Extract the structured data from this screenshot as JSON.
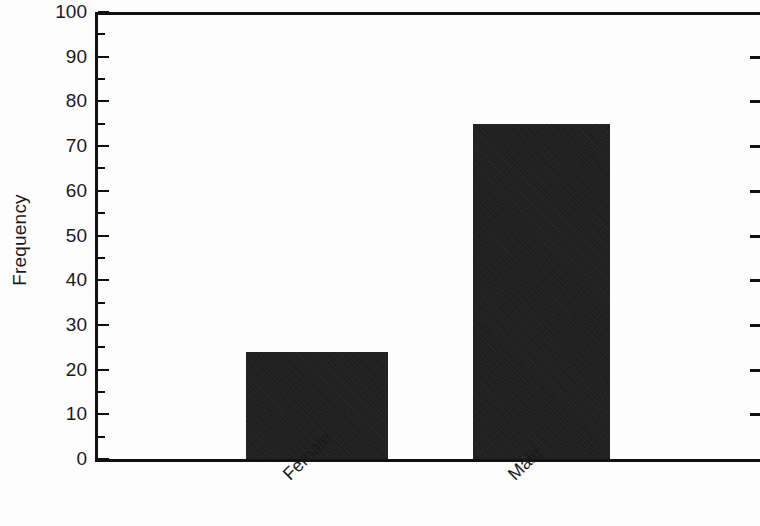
{
  "chart_data": {
    "type": "bar",
    "title": "",
    "subtitle": "",
    "xlabel": "",
    "ylabel": "Frequency",
    "categories": [
      "Female",
      "Male"
    ],
    "values": [
      24,
      75
    ],
    "series": [
      {
        "name": "Frequency",
        "values": [
          24,
          75
        ]
      }
    ],
    "ylim": [
      0,
      100
    ],
    "y_major_ticks": [
      0,
      10,
      20,
      30,
      40,
      50,
      60,
      70,
      80,
      90,
      100
    ],
    "y_minor_tick_interval": 5,
    "y_tick_labels": [
      "0",
      "10",
      "20",
      "30",
      "40",
      "50",
      "60",
      "70",
      "80",
      "90",
      "100"
    ],
    "grid": false,
    "legend": null,
    "legend_position": "none",
    "bar_color": "#181818",
    "axis_color": "#111111",
    "background_color": "#ffffff",
    "x_tick_label_rotation": -45,
    "annotations": []
  },
  "axis": {
    "y_title": "Frequency",
    "ticks": [
      {
        "label": "100",
        "value": 100
      },
      {
        "label": "90",
        "value": 90
      },
      {
        "label": "80",
        "value": 80
      },
      {
        "label": "70",
        "value": 70
      },
      {
        "label": "60",
        "value": 60
      },
      {
        "label": "50",
        "value": 50
      },
      {
        "label": "40",
        "value": 40
      },
      {
        "label": "30",
        "value": 30
      },
      {
        "label": "20",
        "value": 20
      },
      {
        "label": "10",
        "value": 10
      },
      {
        "label": "0",
        "value": 0
      }
    ]
  },
  "bars": [
    {
      "label": "Female",
      "value": 24
    },
    {
      "label": "Male",
      "value": 75
    }
  ]
}
